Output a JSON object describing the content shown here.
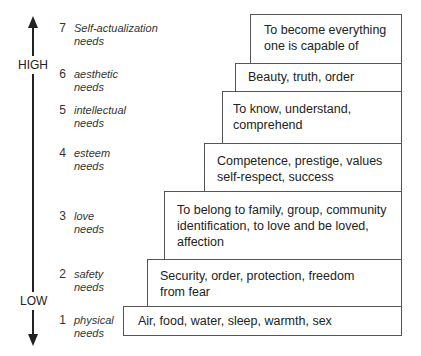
{
  "axis": {
    "high_label": "HIGH",
    "low_label": "LOW"
  },
  "levels": [
    {
      "number": "7",
      "name_line1": "Self-actualization",
      "name_line2": "needs",
      "description": [
        "To become everything",
        "one is capable of"
      ]
    },
    {
      "number": "6",
      "name_line1": "aesthetic",
      "name_line2": "needs",
      "description": [
        "Beauty, truth, order"
      ]
    },
    {
      "number": "5",
      "name_line1": "intellectual",
      "name_line2": "needs",
      "description": [
        "To know, understand,",
        "comprehend"
      ]
    },
    {
      "number": "4",
      "name_line1": "esteem",
      "name_line2": "needs",
      "description": [
        "Competence, prestige, values",
        "self-respect, success"
      ]
    },
    {
      "number": "3",
      "name_line1": "love",
      "name_line2": "needs",
      "description": [
        "To belong to family, group, community",
        "identification, to love and be loved,",
        "affection"
      ]
    },
    {
      "number": "2",
      "name_line1": "safety",
      "name_line2": "needs",
      "description": [
        "Security, order, protection, freedom",
        "from fear"
      ]
    },
    {
      "number": "1",
      "name_line1": "physical",
      "name_line2": "needs",
      "description": [
        "Air, food, water, sleep, warmth, sex"
      ]
    }
  ]
}
